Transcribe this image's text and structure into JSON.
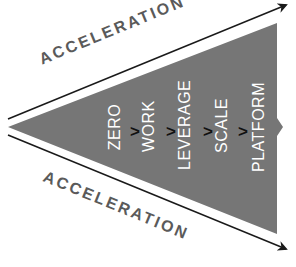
{
  "diagram": {
    "top_label": "ACCELERATION",
    "bottom_label": "ACCELERATION",
    "stages": [
      "ZERO",
      "WORK",
      "LEVERAGE",
      "SCALE",
      "PLATFORM"
    ],
    "separator": ">",
    "caption": "",
    "colors": {
      "wedge": "#767676",
      "arrow": "#1a1a1a",
      "stage_text": "#ffffff",
      "accel_text": "#5a5a5a"
    }
  }
}
